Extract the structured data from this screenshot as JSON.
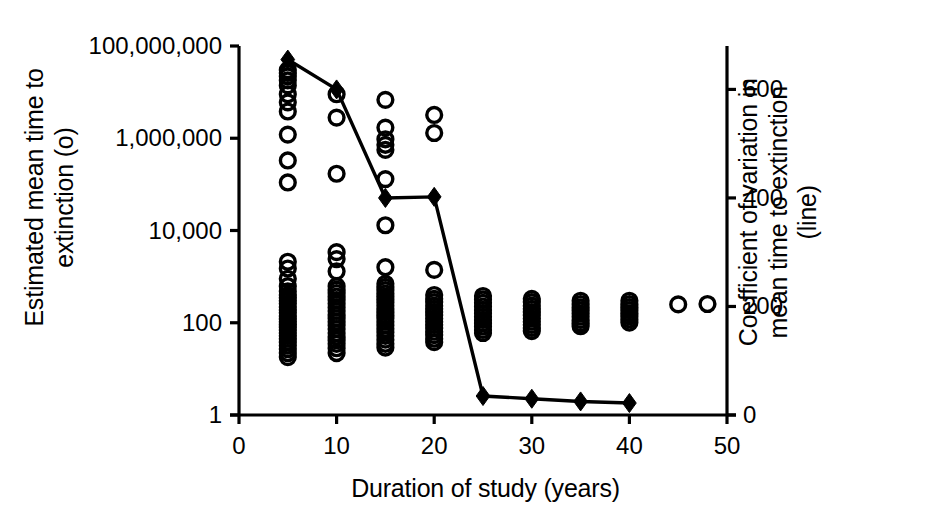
{
  "chart_data": {
    "type": "scatter",
    "title": "",
    "xlabel": "Duration of study (years)",
    "ylabel_left": "Estimated mean time to\nextinction (o)",
    "ylabel_right": "Coefficient of variation in\nmean time to extinction\n(line)",
    "grid": false,
    "legend_position": "none",
    "xlim": [
      0,
      50
    ],
    "xticks": [
      "0",
      "10",
      "20",
      "30",
      "40",
      "50"
    ],
    "xtick_values": [
      0,
      10,
      20,
      30,
      40,
      50
    ],
    "left_axis": {
      "scale": "log",
      "ylim": [
        1,
        100000000
      ],
      "ticks": [
        "1",
        "100",
        "10,000",
        "1,000,000",
        "100,000,000"
      ],
      "tick_values": [
        1,
        100,
        10000,
        1000000,
        100000000
      ]
    },
    "right_axis": {
      "scale": "linear",
      "ylim": [
        0,
        680
      ],
      "ticks": [
        "0",
        "200",
        "400",
        "600"
      ],
      "tick_values": [
        0,
        200,
        400,
        600
      ]
    },
    "series": [
      {
        "name": "Estimated mean time to extinction",
        "marker": "open-circle",
        "axis": "left",
        "points": [
          [
            5,
            30000000
          ],
          [
            5,
            26000000
          ],
          [
            5,
            22000000
          ],
          [
            5,
            18000000
          ],
          [
            5,
            14000000
          ],
          [
            5,
            9000000
          ],
          [
            5,
            6000000
          ],
          [
            5,
            3800000
          ],
          [
            5,
            1200000
          ],
          [
            5,
            330000
          ],
          [
            5,
            110000
          ],
          [
            5,
            2100
          ],
          [
            5,
            1500
          ],
          [
            5,
            900
          ],
          [
            5,
            620
          ],
          [
            5,
            480
          ],
          [
            5,
            400
          ],
          [
            5,
            350
          ],
          [
            5,
            300
          ],
          [
            5,
            260
          ],
          [
            5,
            220
          ],
          [
            5,
            190
          ],
          [
            5,
            165
          ],
          [
            5,
            140
          ],
          [
            5,
            120
          ],
          [
            5,
            105
          ],
          [
            5,
            92
          ],
          [
            5,
            80
          ],
          [
            5,
            70
          ],
          [
            5,
            60
          ],
          [
            5,
            52
          ],
          [
            5,
            45
          ],
          [
            5,
            38
          ],
          [
            5,
            32
          ],
          [
            5,
            27
          ],
          [
            5,
            22
          ],
          [
            5,
            18
          ],
          [
            10,
            9000000
          ],
          [
            10,
            2800000
          ],
          [
            10,
            170000
          ],
          [
            10,
            3400
          ],
          [
            10,
            2400
          ],
          [
            10,
            1300
          ],
          [
            10,
            620
          ],
          [
            10,
            520
          ],
          [
            10,
            440
          ],
          [
            10,
            370
          ],
          [
            10,
            310
          ],
          [
            10,
            260
          ],
          [
            10,
            215
          ],
          [
            10,
            180
          ],
          [
            10,
            150
          ],
          [
            10,
            125
          ],
          [
            10,
            105
          ],
          [
            10,
            88
          ],
          [
            10,
            73
          ],
          [
            10,
            60
          ],
          [
            10,
            50
          ],
          [
            10,
            42
          ],
          [
            10,
            35
          ],
          [
            10,
            28
          ],
          [
            10,
            22
          ],
          [
            15,
            6800000
          ],
          [
            15,
            1700000
          ],
          [
            15,
            950000
          ],
          [
            15,
            720000
          ],
          [
            15,
            560000
          ],
          [
            15,
            130000
          ],
          [
            15,
            13000
          ],
          [
            15,
            1600
          ],
          [
            15,
            700
          ],
          [
            15,
            600
          ],
          [
            15,
            510
          ],
          [
            15,
            430
          ],
          [
            15,
            370
          ],
          [
            15,
            320
          ],
          [
            15,
            275
          ],
          [
            15,
            235
          ],
          [
            15,
            200
          ],
          [
            15,
            170
          ],
          [
            15,
            145
          ],
          [
            15,
            125
          ],
          [
            15,
            105
          ],
          [
            15,
            88
          ],
          [
            15,
            74
          ],
          [
            15,
            62
          ],
          [
            15,
            52
          ],
          [
            15,
            43
          ],
          [
            15,
            35
          ],
          [
            15,
            29
          ],
          [
            20,
            3200000
          ],
          [
            20,
            1300000
          ],
          [
            20,
            1400
          ],
          [
            20,
            400
          ],
          [
            20,
            330
          ],
          [
            20,
            280
          ],
          [
            20,
            235
          ],
          [
            20,
            200
          ],
          [
            20,
            170
          ],
          [
            20,
            145
          ],
          [
            20,
            123
          ],
          [
            20,
            105
          ],
          [
            20,
            90
          ],
          [
            20,
            76
          ],
          [
            20,
            64
          ],
          [
            20,
            54
          ],
          [
            20,
            45
          ],
          [
            20,
            38
          ],
          [
            25,
            380
          ],
          [
            25,
            320
          ],
          [
            25,
            270
          ],
          [
            25,
            225
          ],
          [
            25,
            190
          ],
          [
            25,
            160
          ],
          [
            25,
            135
          ],
          [
            25,
            115
          ],
          [
            25,
            98
          ],
          [
            25,
            83
          ],
          [
            25,
            70
          ],
          [
            25,
            60
          ],
          [
            30,
            330
          ],
          [
            30,
            280
          ],
          [
            30,
            235
          ],
          [
            30,
            200
          ],
          [
            30,
            170
          ],
          [
            30,
            145
          ],
          [
            30,
            123
          ],
          [
            30,
            105
          ],
          [
            30,
            90
          ],
          [
            30,
            77
          ],
          [
            30,
            66
          ],
          [
            35,
            300
          ],
          [
            35,
            255
          ],
          [
            35,
            215
          ],
          [
            35,
            185
          ],
          [
            35,
            158
          ],
          [
            35,
            135
          ],
          [
            35,
            115
          ],
          [
            35,
            98
          ],
          [
            35,
            84
          ],
          [
            40,
            300
          ],
          [
            40,
            255
          ],
          [
            40,
            218
          ],
          [
            40,
            187
          ],
          [
            40,
            160
          ],
          [
            40,
            138
          ],
          [
            40,
            118
          ],
          [
            40,
            101
          ],
          [
            45,
            250
          ],
          [
            48,
            255
          ]
        ]
      },
      {
        "name": "Coefficient of variation in mean time to extinction",
        "marker": "filled-diamond",
        "axis": "right",
        "line": true,
        "x": [
          5,
          10,
          15,
          20,
          25,
          30,
          35,
          40
        ],
        "values": [
          655,
          600,
          400,
          402,
          35,
          30,
          25,
          22
        ]
      }
    ]
  },
  "axes": {
    "x_title": "Duration of study (years)",
    "y_left_title_line1": "Estimated mean time to",
    "y_left_title_line2": "extinction (o)",
    "y_right_title_line1": "Coefficient of variation in",
    "y_right_title_line2": "mean time to extinction",
    "y_right_title_line3": "(line)"
  }
}
